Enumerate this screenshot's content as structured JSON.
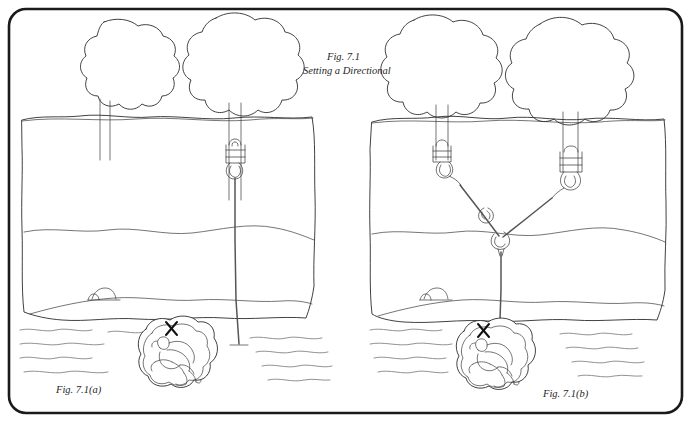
{
  "figure": {
    "title_line1": "Fig. 7.1",
    "title_line2": "Setting a Directional",
    "caption_left": "Fig. 7.1(a)",
    "caption_right": "Fig. 7.1(b)",
    "mark_left": "X",
    "mark_right": "X"
  },
  "panels": [
    {
      "id": "panel-a",
      "caption": "Fig. 7.1(a)",
      "anchor_type": "single-point",
      "tree_count": 2,
      "rope_alignment": "offset-from-target",
      "target_mark": "X"
    },
    {
      "id": "panel-b",
      "caption": "Fig. 7.1(b)",
      "anchor_type": "two-point-directional-V",
      "tree_count": 2,
      "rope_alignment": "aligned-over-target",
      "target_mark": "X"
    }
  ],
  "colors": {
    "ink": "#2b2b2b",
    "rope": "#555555",
    "hardware": "#4a4a4a",
    "frame": "#1a1a1a",
    "water": "#6d6d6d",
    "paper": "#ffffff"
  }
}
